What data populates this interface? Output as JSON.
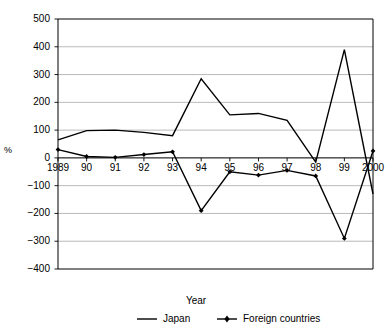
{
  "chart_data": {
    "type": "line",
    "title": "",
    "xlabel": "Year",
    "ylabel": "%",
    "ylim": [
      -400,
      500
    ],
    "ytick_labels": [
      "500",
      "400",
      "300",
      "200",
      "100",
      "0",
      "-100",
      "-200",
      "-300",
      "-400"
    ],
    "ytick_values": [
      500,
      400,
      300,
      200,
      100,
      0,
      -100,
      -200,
      -300,
      -400
    ],
    "grid": true,
    "legend_position": "bottom",
    "categories": [
      "1989",
      "90",
      "91",
      "92",
      "93",
      "94",
      "95",
      "96",
      "97",
      "98",
      "99",
      "2000"
    ],
    "x_values": [
      1989,
      1990,
      1991,
      1992,
      1993,
      1994,
      1995,
      1996,
      1997,
      1998,
      1999,
      2000
    ],
    "series": [
      {
        "name": "Japan",
        "marker": "none",
        "color": "#000000",
        "values": [
          65,
          98,
          100,
          92,
          80,
          285,
          155,
          160,
          135,
          -15,
          390,
          -130
        ]
      },
      {
        "name": "Foreign countries",
        "marker": "diamond",
        "color": "#000000",
        "values": [
          30,
          5,
          2,
          12,
          22,
          -190,
          -50,
          -62,
          -45,
          -65,
          -290,
          25
        ]
      }
    ]
  },
  "axes": {
    "y_unit_label": "%",
    "x_axis_title": "Year"
  },
  "legend": {
    "items": [
      {
        "label": "Japan",
        "marker": "line"
      },
      {
        "label": "Foreign countries",
        "marker": "line-with-marker"
      }
    ]
  },
  "style": {
    "frame_color": "#000000",
    "grid_color": "#a8a8a8",
    "line_color": "#000000",
    "background": "#ffffff"
  }
}
